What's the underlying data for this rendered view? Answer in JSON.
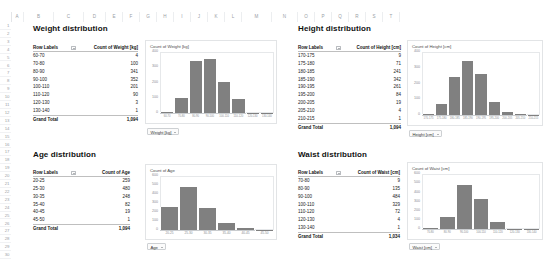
{
  "app": {
    "columns": [
      "A",
      "B",
      "C",
      "D",
      "E",
      "F",
      "G",
      "H",
      "I",
      "J",
      "K",
      "L",
      "M",
      "N",
      "O",
      "P",
      "Q",
      "R",
      "S",
      "T"
    ],
    "rows": [
      "1",
      "2",
      "3",
      "4",
      "5",
      "6",
      "7",
      "8",
      "9",
      "10",
      "11",
      "12",
      "13",
      "14",
      "15",
      "16",
      "17",
      "18",
      "19",
      "20",
      "21",
      "22",
      "23",
      "24",
      "25",
      "26",
      "27",
      "28",
      "29",
      "30"
    ],
    "bar_color": "#808080",
    "grid_line_color": "#e3e5e8"
  },
  "panels": {
    "weight": {
      "title": "Weight distribution",
      "table": {
        "col_label_header": "Row Labels",
        "col_value_header": "Count of Weight [kg]",
        "rows": [
          {
            "label": "60-70",
            "value": "4"
          },
          {
            "label": "70-80",
            "value": "100"
          },
          {
            "label": "80-90",
            "value": "341"
          },
          {
            "label": "90-100",
            "value": "352"
          },
          {
            "label": "100-110",
            "value": "201"
          },
          {
            "label": "110-120",
            "value": "90"
          },
          {
            "label": "120-130",
            "value": "3"
          },
          {
            "label": "130-140",
            "value": "1"
          }
        ],
        "total_label": "Grand Total",
        "total_value": "1,094"
      },
      "chart": {
        "title": "Count of Weight [kg]",
        "field_button": "Weight [kg]"
      },
      "chart_data": {
        "type": "bar",
        "title": "Count of Weight [kg]",
        "xlabel": "Weight [kg]",
        "ylabel": "",
        "categories": [
          "60-70",
          "70-80",
          "80-90",
          "90-100",
          "100-110",
          "110-120",
          "120-130",
          "130-140"
        ],
        "values": [
          4,
          100,
          341,
          352,
          201,
          90,
          3,
          1
        ],
        "ylim": [
          0,
          400
        ],
        "yticks": [
          "0",
          "100",
          "200",
          "300",
          "400"
        ],
        "grid": false,
        "legend": "none"
      }
    },
    "height": {
      "title": "Height distribution",
      "table": {
        "col_label_header": "Row Labels",
        "col_value_header": "Count of Height [cm]",
        "rows": [
          {
            "label": "170-175",
            "value": "9"
          },
          {
            "label": "175-180",
            "value": "71"
          },
          {
            "label": "180-185",
            "value": "241"
          },
          {
            "label": "185-190",
            "value": "342"
          },
          {
            "label": "190-195",
            "value": "261"
          },
          {
            "label": "195-200",
            "value": "84"
          },
          {
            "label": "200-205",
            "value": "19"
          },
          {
            "label": "205-210",
            "value": "4"
          },
          {
            "label": "210-215",
            "value": "1"
          }
        ],
        "total_label": "Grand Total",
        "total_value": "1,094"
      },
      "chart": {
        "title": "Count of Height [cm]",
        "field_button": "Height [cm]"
      },
      "chart_data": {
        "type": "bar",
        "title": "Count of Height [cm]",
        "xlabel": "Height [cm]",
        "ylabel": "",
        "categories": [
          "170-175",
          "175-180",
          "180-185",
          "185-190",
          "190-195",
          "195-200",
          "200-205",
          "205-210",
          "210-215"
        ],
        "values": [
          9,
          71,
          241,
          342,
          261,
          84,
          19,
          4,
          1
        ],
        "ylim": [
          0,
          400
        ],
        "yticks": [
          "0",
          "100",
          "200",
          "300",
          "400"
        ],
        "grid": false,
        "legend": "none"
      }
    },
    "age": {
      "title": "Age distribution",
      "table": {
        "col_label_header": "Row Labels",
        "col_value_header": "Count of Age",
        "rows": [
          {
            "label": "20-25",
            "value": "259"
          },
          {
            "label": "25-30",
            "value": "480"
          },
          {
            "label": "30-35",
            "value": "248"
          },
          {
            "label": "35-40",
            "value": "82"
          },
          {
            "label": "40-45",
            "value": "19"
          },
          {
            "label": "45-50",
            "value": "1"
          }
        ],
        "total_label": "Grand Total",
        "total_value": "1,094"
      },
      "chart": {
        "title": "Count of Age",
        "field_button": "Age"
      },
      "chart_data": {
        "type": "bar",
        "title": "Count of Age",
        "xlabel": "Age",
        "ylabel": "",
        "categories": [
          "20-25",
          "25-30",
          "30-35",
          "35-40",
          "40-45",
          "45-50"
        ],
        "values": [
          259,
          480,
          248,
          82,
          19,
          1
        ],
        "ylim": [
          0,
          600
        ],
        "yticks": [
          "0",
          "100",
          "200",
          "300",
          "400",
          "500",
          "600"
        ],
        "grid": false,
        "legend": "none"
      }
    },
    "waist": {
      "title": "Waist distribution",
      "table": {
        "col_label_header": "Row Labels",
        "col_value_header": "Count of Waist [cm]",
        "rows": [
          {
            "label": "70-80",
            "value": "9"
          },
          {
            "label": "80-90",
            "value": "135"
          },
          {
            "label": "90-100",
            "value": "484"
          },
          {
            "label": "100-110",
            "value": "329"
          },
          {
            "label": "110-120",
            "value": "72"
          },
          {
            "label": "120-130",
            "value": "4"
          },
          {
            "label": "130-140",
            "value": "1"
          }
        ],
        "total_label": "Grand Total",
        "total_value": "1,034"
      },
      "chart": {
        "title": "Count of Waist [cm]",
        "field_button": "Waist [cm]"
      },
      "chart_data": {
        "type": "bar",
        "title": "Count of Waist [cm]",
        "xlabel": "Waist [cm]",
        "ylabel": "",
        "categories": [
          "70-80",
          "80-90",
          "90-100",
          "100-110",
          "110-120",
          "120-130",
          "130-140"
        ],
        "values": [
          9,
          135,
          484,
          329,
          72,
          4,
          1
        ],
        "ylim": [
          0,
          600
        ],
        "yticks": [
          "0",
          "100",
          "200",
          "300",
          "400",
          "500",
          "600"
        ],
        "grid": false,
        "legend": "none"
      }
    }
  }
}
